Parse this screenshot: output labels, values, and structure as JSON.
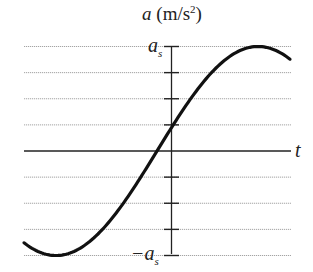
{
  "chart_data": {
    "type": "line",
    "title_var": "a",
    "title_unit_open": " (m/s",
    "title_unit_exp": "2",
    "title_unit_close": ")",
    "xlabel": "t",
    "ylabel": "a (m/s²)",
    "y_tick_labels": {
      "top": "a_s",
      "bottom": "-a_s"
    },
    "y_top_label_main": "a",
    "y_top_label_sub": "s",
    "y_bottom_label_main": "−a",
    "y_bottom_label_sub": "s",
    "ylim": [
      -1,
      1
    ],
    "y_gridlines": [
      1,
      0.75,
      0.5,
      0.25,
      0,
      -0.25,
      -0.5,
      -0.75,
      -1
    ],
    "grid": true,
    "series": [
      {
        "name": "a(t)",
        "description": "sinusoidal acceleration, amplitude a_s, positive at t=0 (≈ a_s/4), rising",
        "amplitude": 1,
        "x": [
          -1.45,
          -1.2,
          -0.8,
          -0.4,
          -0.17,
          0,
          0.4,
          0.8,
          1.2,
          1.6,
          1.85
        ],
        "values": [
          -0.82,
          -1.0,
          -0.91,
          -0.44,
          0.0,
          0.25,
          0.69,
          0.98,
          0.88,
          0.42,
          0.68
        ]
      }
    ],
    "colors": {
      "curve": "#111111",
      "axis": "#222222",
      "grid": "#9a9a9a"
    }
  }
}
